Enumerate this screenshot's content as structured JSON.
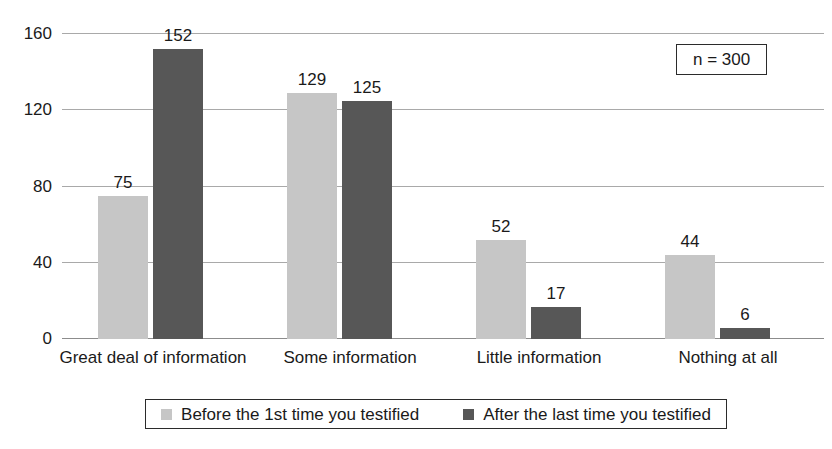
{
  "chart_data": {
    "type": "bar",
    "title": "",
    "subtitle": "",
    "xlabel": "",
    "ylabel": "",
    "categories": [
      "Great deal of information",
      "Some information",
      "Little information",
      "Nothing at all"
    ],
    "series": [
      {
        "name": "Before the 1st time you testified",
        "color": "#c6c6c6",
        "values": [
          75,
          129,
          52,
          44
        ]
      },
      {
        "name": "After the last time you testified",
        "color": "#575757",
        "values": [
          152,
          125,
          17,
          6
        ]
      }
    ],
    "ylim": [
      0,
      160
    ],
    "yticks": [
      0,
      40,
      80,
      120,
      160
    ],
    "ytick_labels": [
      "0",
      "40",
      "80",
      "120",
      "160"
    ],
    "grid": true,
    "legend_position": "bottom",
    "annotations": [
      {
        "name": "sample-size",
        "text": "n = 300"
      }
    ],
    "data_labels": true
  },
  "annotation": {
    "sample_size": "n = 300"
  },
  "legend": {
    "items": [
      {
        "label": "Before the 1st time you testified",
        "color": "#c6c6c6"
      },
      {
        "label": "After the last time you testified",
        "color": "#575757"
      }
    ]
  },
  "colors": {
    "series_light": "#c6c6c6",
    "series_dark": "#575757",
    "gridline": "#a9a9a9",
    "axis": "#8c8c8c",
    "text": "#1a1a1a",
    "background": "#ffffff"
  }
}
